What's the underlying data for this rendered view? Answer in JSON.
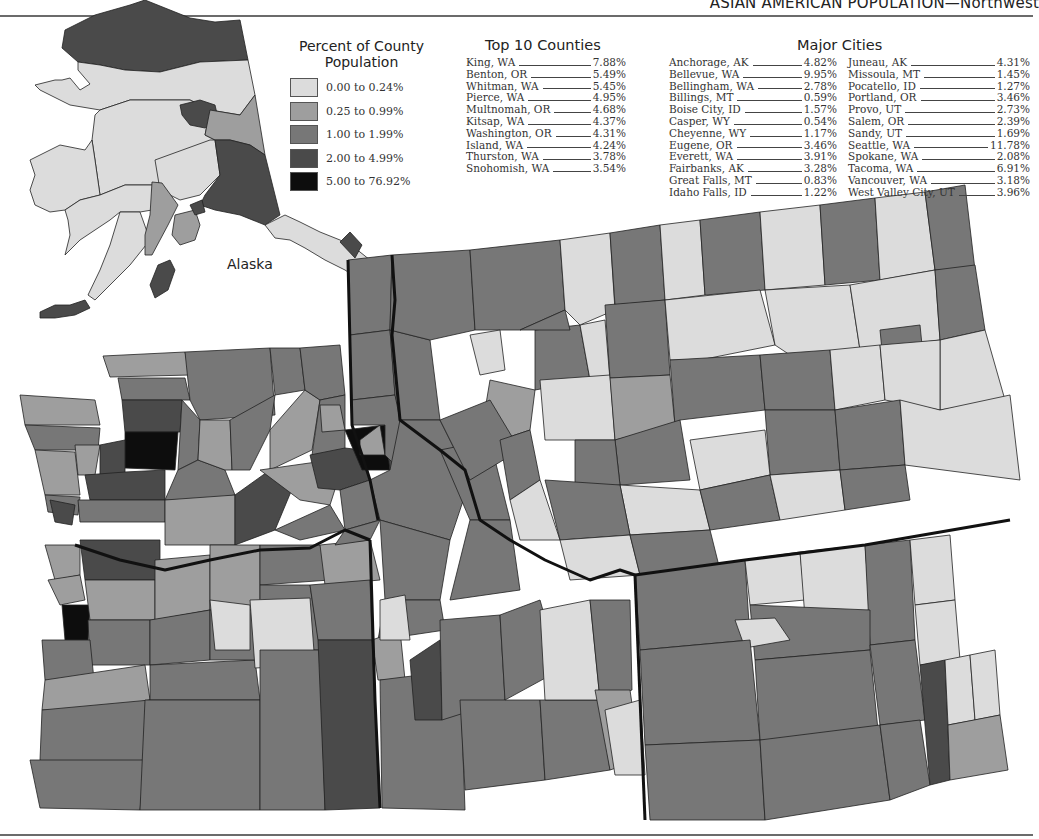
{
  "header": {
    "title": "ASIAN AMERICAN POPULATION—Northwest"
  },
  "legend": {
    "title_line1": "Percent of County",
    "title_line2": "Population",
    "classes": [
      {
        "label": "0.00 to 0.24%",
        "color": "#dcdcdc"
      },
      {
        "label": "0.25 to 0.99%",
        "color": "#9e9e9e"
      },
      {
        "label": "1.00 to 1.99%",
        "color": "#777777"
      },
      {
        "label": "2.00 to 4.99%",
        "color": "#4a4a4a"
      },
      {
        "label": "5.00 to 76.92%",
        "color": "#0d0d0d"
      }
    ]
  },
  "inset": {
    "label": "Alaska"
  },
  "top_counties": {
    "title": "Top 10 Counties",
    "rows": [
      {
        "name": "King, WA",
        "value": "7.88%"
      },
      {
        "name": "Benton, OR",
        "value": "5.49%"
      },
      {
        "name": "Whitman, WA",
        "value": "5.45%"
      },
      {
        "name": "Pierce, WA",
        "value": "4.95%"
      },
      {
        "name": "Multnomah, OR",
        "value": "4.68%"
      },
      {
        "name": "Kitsap, WA",
        "value": "4.37%"
      },
      {
        "name": "Washington, OR",
        "value": "4.31%"
      },
      {
        "name": "Island, WA",
        "value": "4.24%"
      },
      {
        "name": "Thurston, WA",
        "value": "3.78%"
      },
      {
        "name": "Snohomish, WA",
        "value": "3.54%"
      }
    ]
  },
  "major_cities": {
    "title": "Major Cities",
    "col1": [
      {
        "name": "Anchorage, AK",
        "value": "4.82%"
      },
      {
        "name": "Bellevue, WA",
        "value": "9.95%"
      },
      {
        "name": "Bellingham, WA",
        "value": "2.78%"
      },
      {
        "name": "Billings, MT",
        "value": "0.59%"
      },
      {
        "name": "Boise City, ID",
        "value": "1.57%"
      },
      {
        "name": "Casper, WY",
        "value": "0.54%"
      },
      {
        "name": "Cheyenne, WY",
        "value": "1.17%"
      },
      {
        "name": "Eugene, OR",
        "value": "3.46%"
      },
      {
        "name": "Everett, WA",
        "value": "3.91%"
      },
      {
        "name": "Fairbanks, AK",
        "value": "3.28%"
      },
      {
        "name": "Great Falls, MT",
        "value": "0.83%"
      },
      {
        "name": "Idaho Falls, ID",
        "value": "1.22%"
      }
    ],
    "col2": [
      {
        "name": "Juneau, AK",
        "value": "4.31%"
      },
      {
        "name": "Missoula, MT",
        "value": "1.45%"
      },
      {
        "name": "Pocatello, ID",
        "value": "1.27%"
      },
      {
        "name": "Portland, OR",
        "value": "3.46%"
      },
      {
        "name": "Provo, UT",
        "value": "2.73%"
      },
      {
        "name": "Salem, OR",
        "value": "2.39%"
      },
      {
        "name": "Sandy, UT",
        "value": "1.69%"
      },
      {
        "name": "Seattle, WA",
        "value": "11.78%"
      },
      {
        "name": "Spokane, WA",
        "value": "2.08%"
      },
      {
        "name": "Tacoma, WA",
        "value": "6.91%"
      },
      {
        "name": "Vancouver, WA",
        "value": "3.18%"
      },
      {
        "name": "West Valley City, UT",
        "value": "3.96%"
      }
    ]
  },
  "map": {
    "states_shown": [
      "WA",
      "OR",
      "ID",
      "MT",
      "WY",
      "AK"
    ],
    "colors": {
      "c0": "#dcdcdc",
      "c1": "#9e9e9e",
      "c2": "#777777",
      "c3": "#4a4a4a",
      "c4": "#0d0d0d",
      "border": "#222222"
    }
  }
}
